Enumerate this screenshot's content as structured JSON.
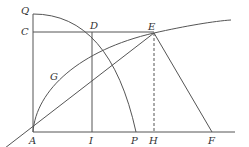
{
  "diagram": {
    "type": "geometry-construction",
    "points": {
      "A": {
        "label": "A",
        "x": 33,
        "y": 132
      },
      "Q": {
        "label": "Q",
        "x": 33,
        "y": 14
      },
      "C": {
        "label": "C",
        "x": 33,
        "y": 32
      },
      "D": {
        "label": "D",
        "x": 92,
        "y": 32
      },
      "E": {
        "label": "E",
        "x": 154,
        "y": 33
      },
      "G": {
        "label": "G",
        "x": 60,
        "y": 76
      },
      "I": {
        "label": "I",
        "x": 92,
        "y": 132
      },
      "P": {
        "label": "P",
        "x": 136,
        "y": 132
      },
      "H": {
        "label": "H",
        "x": 154,
        "y": 132
      },
      "F": {
        "label": "F",
        "x": 212,
        "y": 132
      }
    },
    "labels": {
      "Q": "Q",
      "C": "C",
      "D": "D",
      "E": "E",
      "G": "G",
      "A": "A",
      "I": "I",
      "P": "P",
      "H": "H",
      "F": "F"
    },
    "segments": [
      "A-Q",
      "C-E",
      "D-I",
      "A-F(baseline)",
      "A-E(extended)",
      "E-F",
      "E-H(dashed)"
    ],
    "curves": [
      "arc Q-D-P (quarter circle centered at A)",
      "curve A-G-E continuing right"
    ]
  }
}
